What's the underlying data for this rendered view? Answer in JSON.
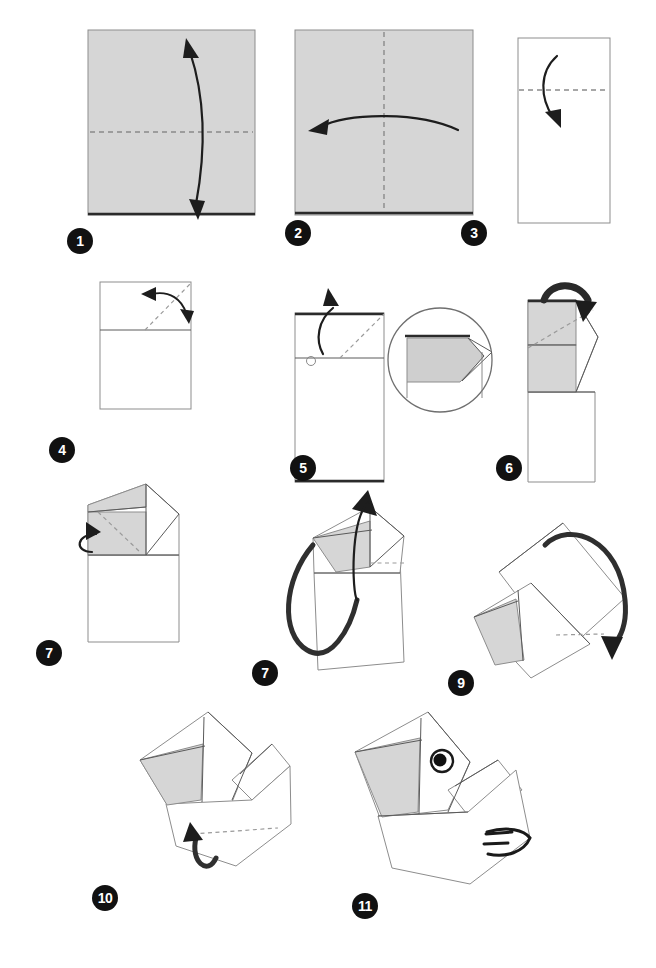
{
  "document": {
    "title": "Origami Folding Instructions",
    "subject": "paper-bird-head",
    "step_count": 11,
    "background_color": "#ffffff",
    "paper_front_color": "#d6d6d6",
    "paper_back_color": "#ffffff",
    "line_color": "#5a5a5a",
    "crease_color": "#8a8a8a",
    "arrow_color": "#1d1d1d",
    "badge_background": "#111111",
    "badge_text_color": "#ffffff"
  },
  "steps": [
    {
      "number": "1",
      "badge_x": 67,
      "badge_y": 228,
      "shape": "square-gray",
      "crease": "horizontal-center",
      "arrow": "vertical-double-curved",
      "note": "Gray square with horizontal dashed valley crease; double-headed curved arrow folds top to bottom."
    },
    {
      "number": "2",
      "badge_x": 285,
      "badge_y": 220,
      "shape": "square-gray",
      "crease": "vertical-center",
      "arrow": "horizontal-left",
      "note": "Gray square with vertical dashed crease; curved arrow folds right half to the left."
    },
    {
      "number": "3",
      "badge_x": 461,
      "badge_y": 220,
      "shape": "tall-rectangle-white",
      "crease": "horizontal-upper",
      "arrow": "short-curved-down",
      "note": "White tall rectangle with upper horizontal dashed crease; arrow folds top edge down."
    },
    {
      "number": "4",
      "badge_x": 49,
      "badge_y": 437,
      "shape": "rectangle-with-top-band",
      "crease": "diagonal-top-right",
      "arrow": "double-curved-fold-unfold",
      "note": "Rectangle with top band; diagonal dashed crease at top right, double-headed arrow for fold and unfold."
    },
    {
      "number": "5",
      "badge_x": 290,
      "badge_y": 455,
      "shape": "rectangle-with-top-band",
      "crease": "diagonal-top-right",
      "arrow": "push-in-up",
      "inset": "circular-detail",
      "note": "Rectangle with diagonal crease and inside-reverse fold arrow; circular inset shows the pocket detail."
    },
    {
      "number": "6",
      "badge_x": 496,
      "badge_y": 455,
      "shape": "folded-flap-gray",
      "crease": "diagonal",
      "arrow": "thick-curved-over",
      "note": "Gray folded flaps with diagonal dashed crease; thick curved arrow wraps the corner over."
    },
    {
      "number": "7",
      "badge_x": 36,
      "badge_y": 640,
      "shape": "folded-flap-gray-peak",
      "crease": "diagonal-inner",
      "arrow": "small-loop-left",
      "note": "Shape with gray top flap and inner diagonal dashed crease; small looping arrow on the left edge."
    },
    {
      "number": "7",
      "badge_x": 252,
      "badge_y": 660,
      "shape": "tilted-folded-form",
      "crease": "short-dashes-right",
      "arrow": "large-loop-up",
      "note": "Tilted form with a large looping arrow rotating the model upward (original sheet repeats number 7)."
    },
    {
      "number": "9",
      "badge_x": 448,
      "badge_y": 670,
      "shape": "rotated-folded-form",
      "crease": "horizontal-dashes",
      "arrow": "arched-over-down",
      "note": "Rotated form with a large arched arrow folding the flap over and down."
    },
    {
      "number": "10",
      "badge_x": 92,
      "badge_y": 885,
      "shape": "bird-body-diagonal",
      "crease": "horizontal-lower-dashes",
      "arrow": "hook-up",
      "note": "Diagonal bird body with lower dashed crease and a hooked arrow folding the bottom point up."
    },
    {
      "number": "11",
      "badge_x": 352,
      "badge_y": 893,
      "shape": "finished-bird",
      "decoration": "eye-and-wing-lines",
      "note": "Finished model: paper bird head with drawn eye and three wing stripes."
    }
  ],
  "annotations": {
    "inset_label": "detail-view",
    "repeated_number_note": "7"
  }
}
